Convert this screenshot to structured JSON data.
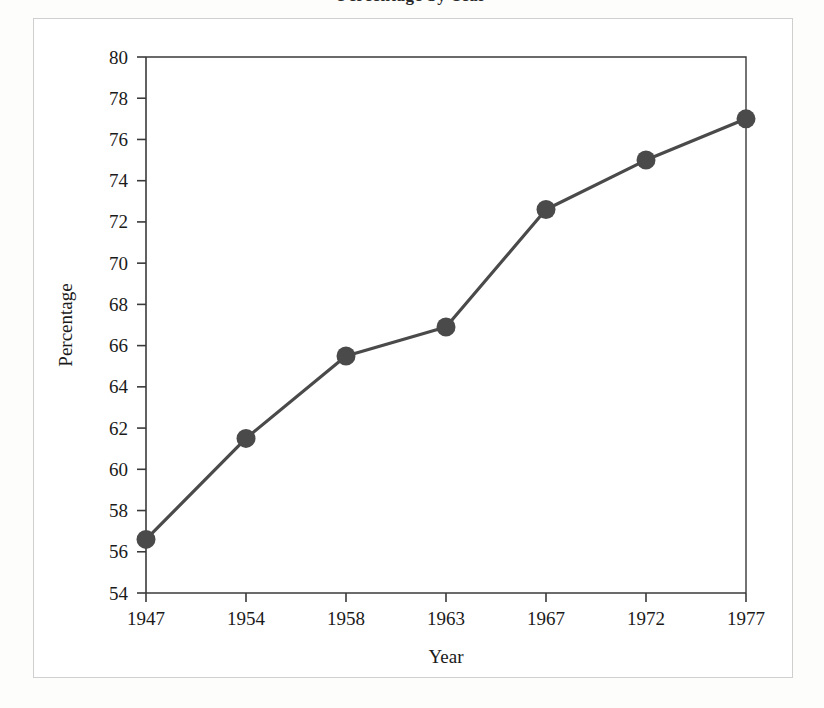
{
  "figure": {
    "caption_sliver": "Percentage by Year",
    "background_color": "#fdfdfc",
    "panel_color": "#ffffff",
    "frame_color": "#cfcfcf"
  },
  "chart_data": {
    "type": "line",
    "title": "",
    "xlabel": "Year",
    "ylabel": "Percentage",
    "categories": [
      "1947",
      "1954",
      "1958",
      "1963",
      "1967",
      "1972",
      "1977"
    ],
    "values": [
      56.6,
      61.5,
      65.5,
      66.9,
      72.6,
      75.0,
      77.0
    ],
    "series": [
      {
        "name": "Percentage",
        "values": [
          56.6,
          61.5,
          65.5,
          66.9,
          72.6,
          75.0,
          77.0
        ],
        "color": "#4a4a4a",
        "marker": "circle"
      }
    ],
    "ylim": [
      54,
      80
    ],
    "ytick_step": 2,
    "yticks": [
      54,
      56,
      58,
      60,
      62,
      64,
      66,
      68,
      70,
      72,
      74,
      76,
      78,
      80
    ],
    "ytick_labels": [
      "54",
      "56",
      "58",
      "60",
      "62",
      "64",
      "66",
      "68",
      "70",
      "72",
      "74",
      "76",
      "78",
      "80"
    ],
    "xticks": [
      "1947",
      "1954",
      "1958",
      "1963",
      "1967",
      "1972",
      "1977"
    ],
    "grid": false,
    "legend": null,
    "legend_position": "none",
    "line_color": "#4a4a4a",
    "marker_color": "#4a4a4a",
    "axis_color": "#3a3a3a",
    "x_scale": "categorical"
  },
  "axes": {
    "y_title": "Percentage",
    "x_title": "Year"
  }
}
